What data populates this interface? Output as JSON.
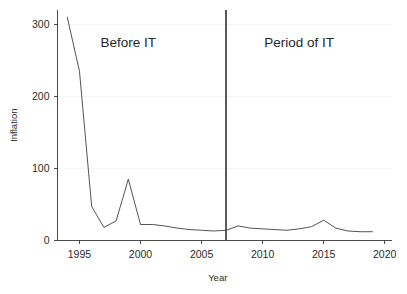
{
  "chart_data": {
    "type": "line",
    "title": "",
    "xlabel": "Year",
    "ylabel": "Inflation",
    "xlim": [
      1993.2,
      2020.6
    ],
    "ylim": [
      -12,
      320
    ],
    "grid": true,
    "legend_position": "none",
    "x_ticks": [
      1995,
      2000,
      2005,
      2010,
      2015,
      2020
    ],
    "x_tick_labels": [
      "1995",
      "2000",
      "2005",
      "2010",
      "2015",
      "2020"
    ],
    "y_ticks": [
      0,
      100,
      200,
      300
    ],
    "y_tick_labels": [
      "0",
      "100",
      "200",
      "300"
    ],
    "series": [
      {
        "name": "Inflation",
        "color": "#4a4a4a",
        "x": [
          1994,
          1995,
          1996,
          1997,
          1998,
          1999,
          2000,
          2001,
          2002,
          2003,
          2004,
          2005,
          2006,
          2007,
          2008,
          2009,
          2010,
          2011,
          2012,
          2013,
          2014,
          2015,
          2016,
          2017,
          2018,
          2019
        ],
        "y": [
          310,
          235,
          47,
          18,
          27,
          85,
          22,
          22,
          20,
          17,
          15,
          14,
          13,
          14,
          20,
          17,
          16,
          15,
          14,
          16,
          19,
          28,
          17,
          13,
          12,
          12
        ]
      }
    ],
    "annotations": [
      {
        "text": "Before IT",
        "x": 1999.0,
        "y": 268
      },
      {
        "text": "Period of IT",
        "x": 2013.0,
        "y": 268
      }
    ],
    "vertical_markers": [
      {
        "x": 2007,
        "label": "IT regime start",
        "color": "#5a5a5a"
      }
    ]
  },
  "labels": {
    "before_it": "Before IT",
    "period_of_it": "Period of IT",
    "x_axis_title": "Year",
    "y_axis_title": "Inflation",
    "tick_1995": "1995",
    "tick_2000": "2000",
    "tick_2005": "2005",
    "tick_2010": "2010",
    "tick_2015": "2015",
    "tick_2020": "2020",
    "tick_0": "0",
    "tick_100": "100",
    "tick_200": "200",
    "tick_300": "300"
  }
}
